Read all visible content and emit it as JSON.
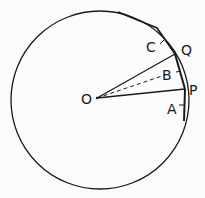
{
  "diagram": {
    "colors": {
      "stroke": "#1a1a1a",
      "background": "#fbfbfb"
    },
    "circle": {
      "cx": 100,
      "cy": 100,
      "r": 89
    },
    "center": {
      "label": "O",
      "x": 97,
      "y": 98
    },
    "points": {
      "Q": {
        "label": "Q",
        "x": 175,
        "y": 54
      },
      "P": {
        "label": "P",
        "x": 185,
        "y": 89
      }
    },
    "labels": {
      "C": {
        "label": "C",
        "x": 146,
        "y": 52
      },
      "Q": {
        "label": "Q",
        "x": 181,
        "y": 54
      },
      "B": {
        "label": "B",
        "x": 162,
        "y": 79
      },
      "P": {
        "label": "P",
        "x": 189,
        "y": 94
      },
      "A": {
        "label": "A",
        "x": 167,
        "y": 113
      },
      "O": {
        "label": "O",
        "x": 81,
        "y": 104
      }
    },
    "lines": [
      {
        "name": "radius-OQ",
        "from": "O",
        "to": "Q",
        "style": "solid"
      },
      {
        "name": "radius-OP",
        "from": "O",
        "to": "P",
        "style": "solid"
      },
      {
        "name": "dashed-OB",
        "from": "O",
        "to": "B",
        "style": "dashed"
      }
    ]
  }
}
